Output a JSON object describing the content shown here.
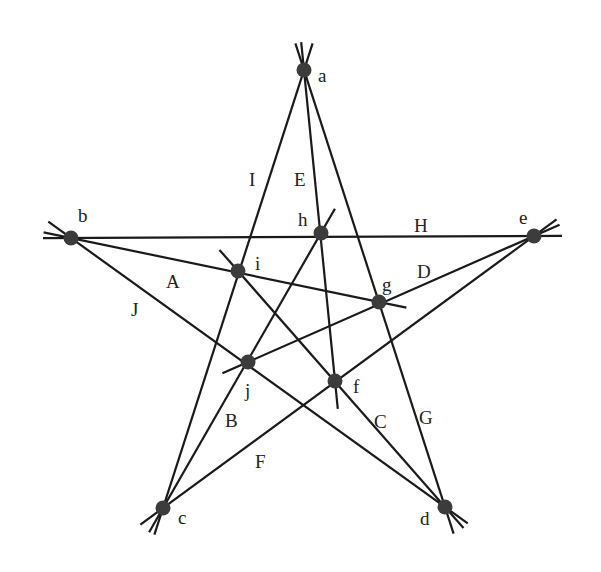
{
  "diagram": {
    "type": "star-configuration",
    "colors": {
      "line": "#1a1a1a",
      "point": "#3c3c3c",
      "label": "#222222",
      "background": "#ffffff"
    },
    "points": [
      {
        "id": "a",
        "x": 304,
        "y": 70,
        "label": "a",
        "lx": 318,
        "ly": 82
      },
      {
        "id": "b",
        "x": 71,
        "y": 238,
        "label": "b",
        "lx": 78,
        "ly": 222
      },
      {
        "id": "c",
        "x": 163,
        "y": 508,
        "label": "c",
        "lx": 178,
        "ly": 524
      },
      {
        "id": "d",
        "x": 445,
        "y": 507,
        "label": "d",
        "lx": 420,
        "ly": 525
      },
      {
        "id": "e",
        "x": 534,
        "y": 236,
        "label": "e",
        "lx": 519,
        "ly": 224
      },
      {
        "id": "f",
        "x": 335,
        "y": 381,
        "label": "f",
        "lx": 353,
        "ly": 393
      },
      {
        "id": "g",
        "x": 379,
        "y": 302,
        "label": "g",
        "lx": 382,
        "ly": 291
      },
      {
        "id": "h",
        "x": 321,
        "y": 233,
        "label": "h",
        "lx": 298,
        "ly": 226
      },
      {
        "id": "i",
        "x": 238,
        "y": 271,
        "label": "i",
        "lx": 255,
        "ly": 270
      },
      {
        "id": "j",
        "x": 248,
        "y": 362,
        "label": "j",
        "lx": 245,
        "ly": 397
      }
    ],
    "lines": [
      {
        "id": "I",
        "from": "a",
        "to": "c",
        "label": "I",
        "lx": 249,
        "ly": 186
      },
      {
        "id": "E",
        "from": "a",
        "to": "f",
        "label": "E",
        "lx": 294,
        "ly": 186
      },
      {
        "id": "G",
        "from": "a",
        "to": "d",
        "label": "G",
        "lx": 419,
        "ly": 424
      },
      {
        "id": "H",
        "from": "b",
        "to": "e",
        "label": "H",
        "lx": 414,
        "ly": 232
      },
      {
        "id": "A",
        "from": "b",
        "to": "g",
        "label": "A",
        "lx": 166,
        "ly": 288
      },
      {
        "id": "J",
        "from": "b",
        "to": "d",
        "label": "J",
        "lx": 131,
        "ly": 316
      },
      {
        "id": "D",
        "from": "e",
        "to": "j",
        "label": "D",
        "lx": 417,
        "ly": 278
      },
      {
        "id": "F",
        "from": "e",
        "to": "c",
        "label": "F",
        "lx": 255,
        "ly": 468
      },
      {
        "id": "B",
        "from": "c",
        "to": "h",
        "label": "B",
        "lx": 225,
        "ly": 427
      },
      {
        "id": "C",
        "from": "d",
        "to": "i",
        "label": "C",
        "lx": 374,
        "ly": 428
      }
    ]
  }
}
